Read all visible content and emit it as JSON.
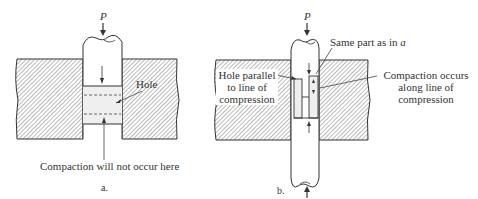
{
  "figure": {
    "panels": [
      {
        "id": "a",
        "caption": "a.",
        "force_label": "P",
        "labels": {
          "hole": "Hole",
          "note": "Compaction will not occur here"
        }
      },
      {
        "id": "b",
        "caption": "b.",
        "force_label": "P",
        "labels": {
          "same_part_prefix": "Same part as in ",
          "same_part_ref": "a",
          "hole_parallel": [
            "Hole parallel",
            "to line of",
            "compression"
          ],
          "compaction_occurs": [
            "Compaction occurs",
            "along line of",
            "compression"
          ]
        }
      }
    ],
    "colors": {
      "line": "#333333",
      "hatch": "#555555",
      "compact_fill": "#eeeeee",
      "background": "#ffffff"
    }
  }
}
